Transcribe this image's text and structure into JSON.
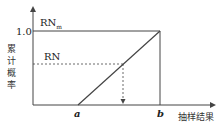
{
  "diagram": {
    "type": "cumulative-probability-line",
    "y_axis_label": [
      "累",
      "计",
      "概",
      "率"
    ],
    "x_axis_label": "抽样结果",
    "y_tick": "1.0",
    "labels": {
      "rn_max": "RN",
      "rn_max_sub": "m",
      "rn": "RN",
      "a": "a",
      "b": "b"
    },
    "colors": {
      "line": "#444444",
      "text": "#222222"
    }
  }
}
